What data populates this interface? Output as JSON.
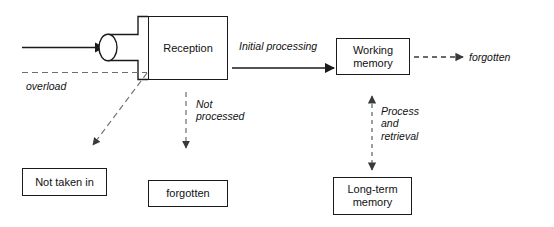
{
  "diagram": {
    "type": "flow-diagram",
    "colors": {
      "stroke": "#1b1b1b",
      "dashed_stroke": "#4a4a4a",
      "text": "#111111",
      "background": "#ffffff"
    },
    "nodes": [
      {
        "id": "reception",
        "label": "Reception",
        "shape": "rect",
        "x": 148,
        "y": 16,
        "w": 80,
        "h": 64
      },
      {
        "id": "working-memory",
        "label": "Working\nmemory",
        "shape": "rect",
        "x": 336,
        "y": 38,
        "w": 74,
        "h": 37
      },
      {
        "id": "long-term-memory",
        "label": "Long-term\nmemory",
        "shape": "rect",
        "x": 333,
        "y": 177,
        "w": 79,
        "h": 38
      },
      {
        "id": "not-taken-in",
        "label": "Not taken in",
        "shape": "rect",
        "x": 22,
        "y": 168,
        "w": 85,
        "h": 28
      },
      {
        "id": "forgotten-box",
        "label": "forgotten",
        "shape": "rect",
        "x": 148,
        "y": 180,
        "w": 80,
        "h": 27
      },
      {
        "id": "bottleneck",
        "label": "",
        "shape": "ellipse-neck",
        "cx": 108,
        "cy": 47,
        "rx": 9,
        "ry": 13
      }
    ],
    "edge_labels": [
      {
        "id": "initial-processing",
        "text": "Initial processing",
        "x": 239,
        "y": 40
      },
      {
        "id": "overload",
        "text": "overload",
        "x": 26,
        "y": 80
      },
      {
        "id": "not-processed",
        "text": "Not\nprocessed",
        "x": 196,
        "y": 98
      },
      {
        "id": "process-and-retrieval",
        "text": "Process\nand\nretrieval",
        "x": 381,
        "y": 105
      }
    ],
    "terminal_labels": [
      {
        "id": "forgotten-terminal",
        "text": "forgotten",
        "x": 469,
        "y": 62
      }
    ],
    "edges": [
      {
        "id": "input-to-bottleneck",
        "style": "solid",
        "arrow": "end",
        "from": "input",
        "to": "bottleneck"
      },
      {
        "id": "reception-to-working-memory",
        "style": "solid",
        "arrow": "end",
        "from": "reception",
        "to": "working-memory",
        "label": "Initial processing"
      },
      {
        "id": "working-memory-to-forgotten",
        "style": "dashed",
        "arrow": "end",
        "from": "working-memory",
        "to": "forgotten-terminal",
        "label": "forgotten"
      },
      {
        "id": "working-memory-long-term-memory",
        "style": "dashed",
        "arrow": "both",
        "from": "working-memory",
        "to": "long-term-memory",
        "label": "Process and retrieval"
      },
      {
        "id": "reception-overload",
        "style": "dashed",
        "arrow": "none",
        "from": "reception",
        "to": "overload-junction",
        "label": "overload"
      },
      {
        "id": "overload-to-not-taken-in",
        "style": "dashed",
        "arrow": "end",
        "from": "overload-junction",
        "to": "not-taken-in"
      },
      {
        "id": "reception-to-forgotten-box",
        "style": "dashed",
        "arrow": "end",
        "from": "reception",
        "to": "forgotten-box",
        "label": "Not processed"
      }
    ]
  }
}
